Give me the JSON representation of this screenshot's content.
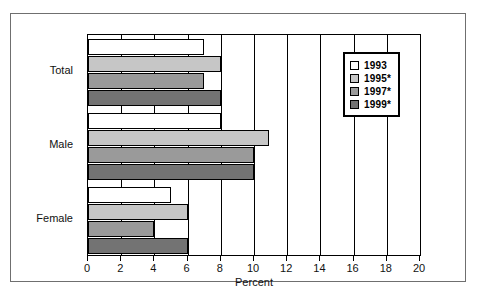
{
  "chart_data": {
    "type": "bar",
    "orientation": "horizontal",
    "title": "",
    "xlabel": "Percent",
    "ylabel": "",
    "xlim": [
      0,
      20
    ],
    "xticks": [
      0,
      2,
      4,
      6,
      8,
      10,
      12,
      14,
      16,
      18,
      20
    ],
    "grid": true,
    "legend_position": "top-right",
    "categories": [
      "Total",
      "Male",
      "Female"
    ],
    "series": [
      {
        "name": "1993",
        "color": "#ffffff",
        "values": [
          7.0,
          8.0,
          5.0
        ]
      },
      {
        "name": "1995*",
        "color": "#c6c6c6",
        "values": [
          8.0,
          10.9,
          6.0
        ]
      },
      {
        "name": "1997*",
        "color": "#9a9a9a",
        "values": [
          7.0,
          10.0,
          4.0
        ]
      },
      {
        "name": "1999*",
        "color": "#737373",
        "values": [
          8.0,
          10.0,
          6.0
        ]
      }
    ]
  },
  "axis": {
    "x_title": "Percent",
    "tick_labels": [
      "0",
      "2",
      "4",
      "6",
      "8",
      "10",
      "12",
      "14",
      "16",
      "18",
      "20"
    ]
  },
  "categories": [
    {
      "label": "Total"
    },
    {
      "label": "Male"
    },
    {
      "label": "Female"
    }
  ],
  "legend": {
    "items": [
      {
        "label": "1993",
        "color": "#ffffff"
      },
      {
        "label": "1995*",
        "color": "#c6c6c6"
      },
      {
        "label": "1997*",
        "color": "#9a9a9a"
      },
      {
        "label": "1999*",
        "color": "#737373"
      }
    ]
  }
}
